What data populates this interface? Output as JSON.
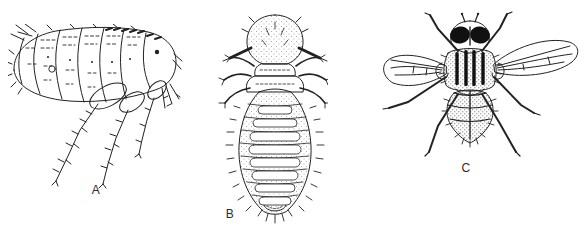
{
  "figure": {
    "background_color": "#ffffff",
    "ink_color": "#222222",
    "label_color": "#2b2b2b",
    "panels": [
      {
        "label": "A",
        "subject": "flea-lateral-view-illustration"
      },
      {
        "label": "B",
        "subject": "chewing-louse-dorsal-view-illustration"
      },
      {
        "label": "C",
        "subject": "house-fly-dorsal-view-illustration"
      }
    ]
  }
}
